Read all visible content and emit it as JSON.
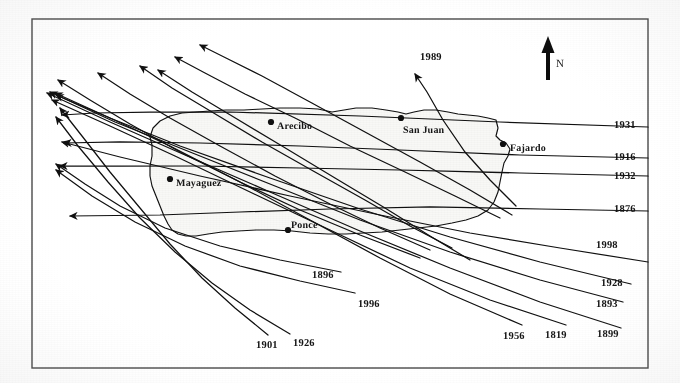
{
  "figure": {
    "frame": {
      "x": 32,
      "y": 19,
      "width": 616,
      "height": 349,
      "color": "#4a4a4a"
    },
    "ink_color": "#151515",
    "land_fill": "#f2f2f0",
    "background": "#fdfdfd"
  },
  "north_arrow": {
    "label": "N",
    "x": 548,
    "y": 36,
    "length": 44
  },
  "cities": [
    {
      "name": "Arecibo",
      "label_x": 277,
      "label_y": 121,
      "dot_x": 271,
      "dot_y": 122
    },
    {
      "name": "San Juan",
      "label_x": 403,
      "label_y": 125,
      "dot_x": 401,
      "dot_y": 118
    },
    {
      "name": "Fajardo",
      "label_x": 510,
      "label_y": 143,
      "dot_x": 503,
      "dot_y": 144
    },
    {
      "name": "Mayaguez",
      "label_x": 176,
      "label_y": 178,
      "dot_x": 170,
      "dot_y": 179
    },
    {
      "name": "Ponce",
      "label_x": 291,
      "label_y": 220,
      "dot_x": 288,
      "dot_y": 230
    }
  ],
  "tracks": [
    {
      "year": "1931",
      "label_x": 614,
      "label_y": 120,
      "path": "M 648 127 L 500 122 L 360 116 L 230 112 L 150 112 L 95 113 L 62 115",
      "arrow_at": "end"
    },
    {
      "year": "1916",
      "label_x": 614,
      "label_y": 152,
      "path": "M 648 158 L 520 155 L 400 150 L 300 146 L 200 143 L 120 142 L 64 143",
      "arrow_at": "end"
    },
    {
      "year": "1932",
      "label_x": 614,
      "label_y": 171,
      "path": "M 648 176 L 520 173 L 400 170 L 300 168 L 200 166 L 120 166 L 60 166",
      "arrow_at": "end"
    },
    {
      "year": "1876",
      "label_x": 614,
      "label_y": 204,
      "path": "M 648 211 L 540 209 L 430 207 L 330 209 L 240 212 L 160 215 L 70 216",
      "arrow_at": "end"
    },
    {
      "year": "1998",
      "label_x": 596,
      "label_y": 240,
      "path": "M 648 262 L 560 248 L 470 233 L 380 215 L 290 196 L 200 176 L 120 157 L 62 142",
      "arrow_at": "end"
    },
    {
      "year": "1928",
      "label_x": 601,
      "label_y": 278,
      "path": "M 631 284 L 540 262 L 450 237 L 360 209 L 270 178 L 180 146 L 110 118 L 56 95",
      "arrow_at": "end"
    },
    {
      "year": "1893",
      "label_x": 596,
      "label_y": 299,
      "path": "M 623 302 L 540 280 L 450 252 L 360 220 L 275 186 L 190 152 L 115 122 L 50 92",
      "arrow_at": "end"
    },
    {
      "year": "1899",
      "label_x": 597,
      "label_y": 329,
      "path": "M 621 328 L 540 302 L 450 268 L 360 231 L 270 192 L 185 155 L 110 122 L 47 93",
      "arrow_at": "end"
    },
    {
      "year": "1819",
      "label_x": 545,
      "label_y": 330,
      "path": "M 566 325 L 490 300 L 410 268 L 330 230 L 250 192 L 175 156 L 110 126 L 52 100",
      "arrow_at": "end"
    },
    {
      "year": "1956",
      "label_x": 503,
      "label_y": 331,
      "path": "M 522 325 L 450 294 L 380 258 L 310 220 L 240 182 L 170 146 L 110 118 L 55 93",
      "arrow_at": "end"
    },
    {
      "year": "1989",
      "label_x": 420,
      "label_y": 52,
      "path": "M 516 206 L 490 180 L 465 152 L 443 120 L 427 92 L 415 74",
      "arrow_at": "end"
    },
    {
      "year": "1896",
      "label_x": 312,
      "label_y": 270,
      "path": "M 341 272 L 280 260 L 220 246 L 165 228 L 120 206 L 85 184 L 56 164",
      "arrow_at": "end"
    },
    {
      "year": "1996",
      "label_x": 358,
      "label_y": 299,
      "path": "M 355 293 L 300 281 L 240 266 L 185 246 L 135 222 L 92 196 L 56 170",
      "arrow_at": "end"
    },
    {
      "year": "1926",
      "label_x": 293,
      "label_y": 338,
      "path": "M 290 334 L 250 310 L 212 283 L 175 252 L 140 218 L 108 182 L 78 146 L 56 117",
      "arrow_at": "end"
    },
    {
      "year": "1901",
      "label_x": 256,
      "label_y": 340,
      "path": "M 268 335 L 235 308 L 202 278 L 170 244 L 140 208 L 110 172 L 82 136 L 60 108",
      "arrow_at": "end"
    },
    {
      "year": "",
      "label_x": 0,
      "label_y": 0,
      "path": "M 420 258 L 360 235 L 300 210 L 240 182 L 180 152 L 130 124 L 90 100 L 58 80",
      "arrow_at": "end"
    },
    {
      "year": "",
      "label_x": 0,
      "label_y": 0,
      "path": "M 430 250 L 380 228 L 330 204 L 275 176 L 220 146 L 170 118 L 130 94 L 98 73",
      "arrow_at": "end"
    },
    {
      "year": "",
      "label_x": 0,
      "label_y": 0,
      "path": "M 452 248 L 410 226 L 365 200 L 315 172 L 262 142 L 212 112 L 172 88 L 140 66",
      "arrow_at": "end"
    },
    {
      "year": "",
      "label_x": 0,
      "label_y": 0,
      "path": "M 470 260 L 430 236 L 385 208 L 335 178 L 282 146 L 232 116 L 192 92 L 158 70",
      "arrow_at": "end"
    },
    {
      "year": "",
      "label_x": 0,
      "label_y": 0,
      "path": "M 500 218 L 455 196 L 405 172 L 350 146 L 295 118 L 245 94 L 205 73 L 175 57",
      "arrow_at": "end"
    },
    {
      "year": "",
      "label_x": 0,
      "label_y": 0,
      "path": "M 512 215 L 470 190 L 420 162 L 365 132 L 310 102 L 262 76 L 226 58 L 200 45",
      "arrow_at": "end"
    }
  ],
  "island_outline": "M 152 145 L 150 137 L 153 128 L 160 121 L 170 116 L 182 113 L 196 112 L 210 111 L 226 110 L 244 110 L 262 109 L 280 108 L 300 108 L 318 109 L 332 112 L 344 110 L 356 108 L 372 108 L 386 110 L 398 112 L 406 114 L 414 112 L 424 110 L 436 110 L 448 112 L 458 114 L 468 115 L 478 116 L 488 118 L 496 120 L 498 128 L 496 136 L 500 140 L 506 143 L 510 149 L 508 156 L 504 163 L 502 172 L 500 182 L 498 192 L 494 202 L 488 210 L 478 216 L 466 220 L 452 223 L 436 226 L 418 228 L 400 230 L 382 232 L 364 233 L 346 234 L 328 234 L 310 233 L 292 231 L 274 230 L 256 230 L 238 231 L 222 232 L 208 234 L 196 236 L 186 236 L 178 234 L 172 230 L 168 224 L 164 216 L 160 206 L 156 196 L 152 186 L 150 176 L 150 166 L 152 156 Z"
}
